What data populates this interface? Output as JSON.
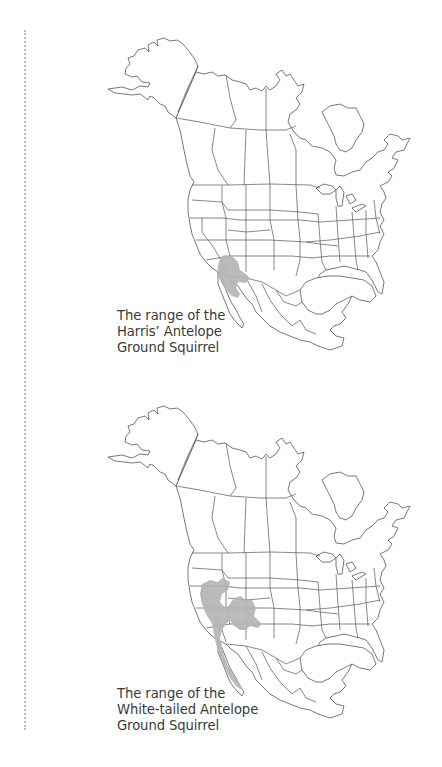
{
  "page": {
    "background": "#ffffff",
    "rule_style": "dotted",
    "rule_color": "#b9b9b9"
  },
  "maps": [
    {
      "region": "North America",
      "caption_lines": [
        "The range of the",
        "Harris’ Antelope",
        "Ground Squirrel"
      ],
      "species": "Harris’ Antelope Ground Squirrel",
      "range_color": "#b4b4b4",
      "range_areas": [
        "southern Arizona",
        "southwestern New Mexico",
        "northern Sonora"
      ]
    },
    {
      "region": "North America",
      "caption_lines": [
        "The range of the",
        "White-tailed Antelope",
        "Ground Squirrel"
      ],
      "species": "White-tailed Antelope Ground Squirrel",
      "range_color": "#b4b4b4",
      "range_areas": [
        "southeastern Oregon",
        "southern Idaho",
        "Nevada",
        "Utah",
        "western Colorado",
        "northwestern New Mexico",
        "eastern California",
        "Baja California"
      ]
    }
  ],
  "colors": {
    "outline": "#555555",
    "range_fill": "#b4b4b4",
    "caption_text": "#3a3a3a"
  }
}
